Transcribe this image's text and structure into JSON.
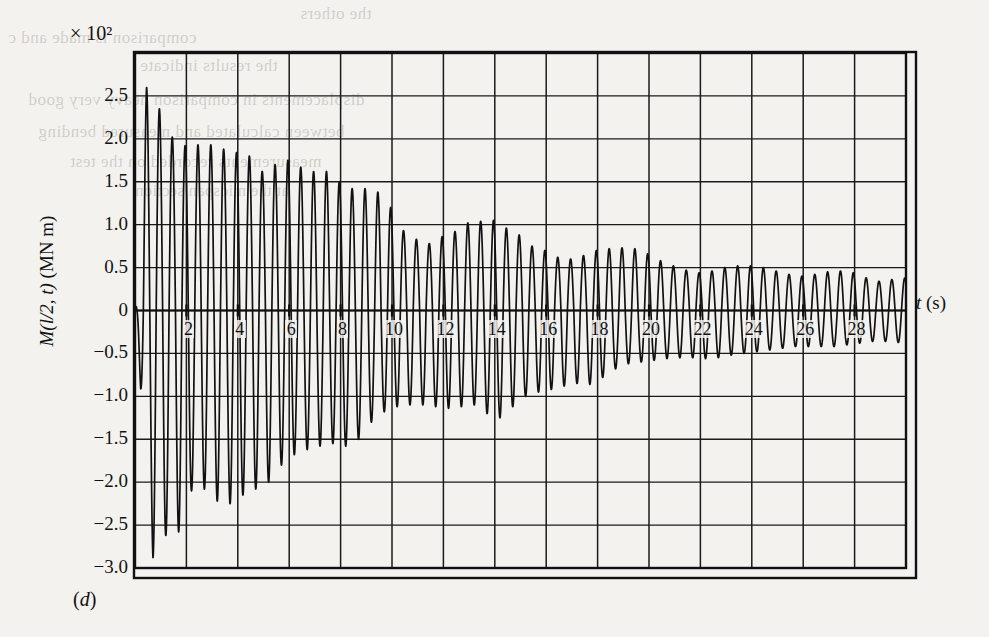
{
  "figure": {
    "panel_label": "(d)",
    "exponent_label": "× 10²"
  },
  "chart_data": {
    "type": "line",
    "title": "",
    "subtitle": "",
    "xlabel": "t (s)",
    "ylabel": "M(l/2, t) (MN m)",
    "y_multiplier": "× 10²",
    "xlim": [
      0,
      30
    ],
    "ylim": [
      -3.0,
      3.0
    ],
    "grid": true,
    "legend": null,
    "xticks": [
      2,
      4,
      6,
      8,
      10,
      12,
      14,
      16,
      18,
      20,
      22,
      24,
      26,
      28
    ],
    "xtick_labels": [
      "2",
      "4",
      "6",
      "8",
      "10",
      "12",
      "14",
      "16",
      "18",
      "20",
      "22",
      "24",
      "26",
      "28"
    ],
    "x_gridlines": [
      0,
      2,
      4,
      6,
      8,
      10,
      12,
      14,
      16,
      18,
      20,
      22,
      24,
      26,
      28,
      30
    ],
    "yticks": [
      2.5,
      2.0,
      1.5,
      1.0,
      0.5,
      0,
      -0.5,
      -1.0,
      -1.5,
      -2.0,
      -2.5,
      -3.0
    ],
    "ytick_labels": [
      "2.5",
      "2.0",
      "1.5",
      "1.0",
      "0.5",
      "0",
      "−0.5",
      "−1.0",
      "−1.5",
      "−2.0",
      "−2.5",
      "−3.0"
    ],
    "y_gridlines": [
      2.5,
      2.0,
      1.5,
      1.0,
      0.5,
      0,
      -0.5,
      -1.0,
      -1.5,
      -2.0,
      -2.5,
      -3.0
    ],
    "series": [
      {
        "name": "M(l/2, t)",
        "color": "#111111",
        "description": "Damped beating bending-moment response at midspan",
        "envelope_positive": [
          {
            "t": 0.0,
            "v": 0.38
          },
          {
            "t": 0.45,
            "v": 2.6
          },
          {
            "t": 0.95,
            "v": 2.35
          },
          {
            "t": 1.45,
            "v": 2.02
          },
          {
            "t": 1.95,
            "v": 1.92
          },
          {
            "t": 2.45,
            "v": 1.93
          },
          {
            "t": 2.95,
            "v": 1.93
          },
          {
            "t": 3.45,
            "v": 1.88
          },
          {
            "t": 3.95,
            "v": 1.84
          },
          {
            "t": 4.45,
            "v": 1.8
          },
          {
            "t": 4.95,
            "v": 1.62
          },
          {
            "t": 5.45,
            "v": 1.7
          },
          {
            "t": 5.95,
            "v": 1.75
          },
          {
            "t": 6.45,
            "v": 1.67
          },
          {
            "t": 6.95,
            "v": 1.62
          },
          {
            "t": 7.45,
            "v": 1.62
          },
          {
            "t": 7.95,
            "v": 1.5
          },
          {
            "t": 8.45,
            "v": 1.42
          },
          {
            "t": 8.95,
            "v": 1.42
          },
          {
            "t": 9.45,
            "v": 1.38
          },
          {
            "t": 9.95,
            "v": 1.2
          },
          {
            "t": 10.45,
            "v": 0.93
          },
          {
            "t": 10.95,
            "v": 0.83
          },
          {
            "t": 11.45,
            "v": 0.78
          },
          {
            "t": 11.95,
            "v": 0.86
          },
          {
            "t": 12.45,
            "v": 0.92
          },
          {
            "t": 12.95,
            "v": 1.02
          },
          {
            "t": 13.45,
            "v": 1.04
          },
          {
            "t": 13.95,
            "v": 1.05
          },
          {
            "t": 14.45,
            "v": 0.96
          },
          {
            "t": 14.95,
            "v": 0.88
          },
          {
            "t": 15.45,
            "v": 0.75
          },
          {
            "t": 15.95,
            "v": 0.7
          },
          {
            "t": 16.45,
            "v": 0.62
          },
          {
            "t": 16.95,
            "v": 0.6
          },
          {
            "t": 17.45,
            "v": 0.64
          },
          {
            "t": 17.95,
            "v": 0.7
          },
          {
            "t": 18.45,
            "v": 0.72
          },
          {
            "t": 18.95,
            "v": 0.73
          },
          {
            "t": 19.45,
            "v": 0.72
          },
          {
            "t": 19.95,
            "v": 0.66
          },
          {
            "t": 20.45,
            "v": 0.58
          },
          {
            "t": 20.95,
            "v": 0.52
          },
          {
            "t": 21.45,
            "v": 0.47
          },
          {
            "t": 21.95,
            "v": 0.44
          },
          {
            "t": 22.45,
            "v": 0.46
          },
          {
            "t": 22.95,
            "v": 0.5
          },
          {
            "t": 23.45,
            "v": 0.52
          },
          {
            "t": 23.95,
            "v": 0.52
          },
          {
            "t": 24.45,
            "v": 0.5
          },
          {
            "t": 24.95,
            "v": 0.46
          },
          {
            "t": 25.45,
            "v": 0.42
          },
          {
            "t": 25.95,
            "v": 0.4
          },
          {
            "t": 26.45,
            "v": 0.42
          },
          {
            "t": 26.95,
            "v": 0.45
          },
          {
            "t": 27.45,
            "v": 0.46
          },
          {
            "t": 27.95,
            "v": 0.44
          },
          {
            "t": 28.45,
            "v": 0.38
          },
          {
            "t": 28.95,
            "v": 0.34
          },
          {
            "t": 29.45,
            "v": 0.36
          },
          {
            "t": 30.0,
            "v": 0.38
          }
        ],
        "envelope_negative": [
          {
            "t": 0.0,
            "v": -0.05
          },
          {
            "t": 0.7,
            "v": -2.88
          },
          {
            "t": 1.2,
            "v": -2.62
          },
          {
            "t": 1.7,
            "v": -2.58
          },
          {
            "t": 2.2,
            "v": -2.1
          },
          {
            "t": 2.7,
            "v": -2.08
          },
          {
            "t": 3.2,
            "v": -2.22
          },
          {
            "t": 3.7,
            "v": -2.25
          },
          {
            "t": 4.2,
            "v": -2.15
          },
          {
            "t": 4.7,
            "v": -2.08
          },
          {
            "t": 5.2,
            "v": -2.0
          },
          {
            "t": 5.7,
            "v": -1.8
          },
          {
            "t": 6.2,
            "v": -1.68
          },
          {
            "t": 6.7,
            "v": -1.62
          },
          {
            "t": 7.2,
            "v": -1.58
          },
          {
            "t": 7.7,
            "v": -1.55
          },
          {
            "t": 8.2,
            "v": -1.58
          },
          {
            "t": 8.7,
            "v": -1.5
          },
          {
            "t": 9.2,
            "v": -1.3
          },
          {
            "t": 9.7,
            "v": -1.18
          },
          {
            "t": 10.2,
            "v": -1.12
          },
          {
            "t": 10.7,
            "v": -1.1
          },
          {
            "t": 11.2,
            "v": -1.1
          },
          {
            "t": 11.7,
            "v": -1.12
          },
          {
            "t": 12.2,
            "v": -1.14
          },
          {
            "t": 12.7,
            "v": -1.12
          },
          {
            "t": 13.2,
            "v": -1.1
          },
          {
            "t": 13.7,
            "v": -1.2
          },
          {
            "t": 14.2,
            "v": -1.25
          },
          {
            "t": 14.7,
            "v": -1.12
          },
          {
            "t": 15.2,
            "v": -1.0
          },
          {
            "t": 15.7,
            "v": -0.95
          },
          {
            "t": 16.2,
            "v": -0.92
          },
          {
            "t": 16.7,
            "v": -0.88
          },
          {
            "t": 17.2,
            "v": -0.85
          },
          {
            "t": 17.7,
            "v": -0.86
          },
          {
            "t": 18.2,
            "v": -0.78
          },
          {
            "t": 18.7,
            "v": -0.68
          },
          {
            "t": 19.2,
            "v": -0.62
          },
          {
            "t": 19.7,
            "v": -0.6
          },
          {
            "t": 20.2,
            "v": -0.58
          },
          {
            "t": 20.7,
            "v": -0.56
          },
          {
            "t": 21.2,
            "v": -0.55
          },
          {
            "t": 21.7,
            "v": -0.55
          },
          {
            "t": 22.2,
            "v": -0.56
          },
          {
            "t": 22.7,
            "v": -0.55
          },
          {
            "t": 23.2,
            "v": -0.52
          },
          {
            "t": 23.7,
            "v": -0.5
          },
          {
            "t": 24.2,
            "v": -0.48
          },
          {
            "t": 24.7,
            "v": -0.46
          },
          {
            "t": 25.2,
            "v": -0.44
          },
          {
            "t": 25.7,
            "v": -0.42
          },
          {
            "t": 26.2,
            "v": -0.42
          },
          {
            "t": 26.7,
            "v": -0.42
          },
          {
            "t": 27.2,
            "v": -0.42
          },
          {
            "t": 27.7,
            "v": -0.4
          },
          {
            "t": 28.2,
            "v": -0.38
          },
          {
            "t": 28.7,
            "v": -0.36
          },
          {
            "t": 29.2,
            "v": -0.36
          },
          {
            "t": 30.0,
            "v": -0.38
          }
        ],
        "oscillation_period_s": 0.5,
        "phase_offset_s": 0.45
      }
    ]
  },
  "bleed_text": [
    {
      "text": "the others",
      "x": 300,
      "y": 4,
      "size": 17
    },
    {
      "text": "comparison is made and c",
      "x": 8,
      "y": 28,
      "size": 17
    },
    {
      "text": "the results indicate",
      "x": 140,
      "y": 56,
      "size": 17
    },
    {
      "text": "displacements in comparison heavy very good",
      "x": 28,
      "y": 90,
      "size": 17
    },
    {
      "text": "between calculated and measured bending",
      "x": 38,
      "y": 122,
      "size": 17
    },
    {
      "text": "measurements recorded on the test",
      "x": 70,
      "y": 152,
      "size": 17
    },
    {
      "text": "at the midspan section",
      "x": 135,
      "y": 182,
      "size": 16
    }
  ]
}
